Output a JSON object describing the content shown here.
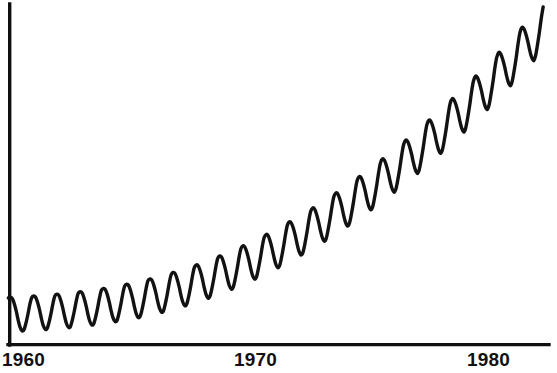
{
  "chart_data": {
    "type": "line",
    "title": "",
    "subtitle": "",
    "xlabel": "",
    "ylabel": "",
    "grid": false,
    "legend": null,
    "legend_position": "none",
    "series_color": "#121212",
    "axis_color": "#101010",
    "background_color": "#ffffff",
    "xlim": [
      1959.2,
      1982.3
    ],
    "ylim": [
      0,
      100
    ],
    "x_tick_labels": [
      "1960",
      "1970",
      "1980"
    ],
    "x_tick_values": [
      1960,
      1970,
      1980
    ],
    "y_tick_labels": [],
    "y_tick_values": [],
    "annotations": [],
    "series": [
      {
        "name": "series-1",
        "x": [
          1959.2,
          1959.29,
          1959.37,
          1959.45,
          1959.54,
          1959.62,
          1959.7,
          1959.79,
          1959.87,
          1959.95,
          1960.04,
          1960.12,
          1960.2,
          1960.29,
          1960.37,
          1960.45,
          1960.54,
          1960.62,
          1960.7,
          1960.79,
          1960.87,
          1960.95,
          1961.04,
          1961.12,
          1961.2,
          1961.29,
          1961.37,
          1961.45,
          1961.54,
          1961.62,
          1961.7,
          1961.79,
          1961.87,
          1961.95,
          1962.04,
          1962.12,
          1962.2,
          1962.29,
          1962.37,
          1962.45,
          1962.54,
          1962.62,
          1962.7,
          1962.79,
          1962.87,
          1962.95,
          1963.04,
          1963.12,
          1963.2,
          1963.29,
          1963.37,
          1963.45,
          1963.54,
          1963.62,
          1963.7,
          1963.79,
          1963.87,
          1963.95,
          1964.04,
          1964.12,
          1964.2,
          1964.29,
          1964.37,
          1964.45,
          1964.54,
          1964.62,
          1964.7,
          1964.79,
          1964.87,
          1964.95,
          1965.04,
          1965.12,
          1965.2,
          1965.29,
          1965.37,
          1965.45,
          1965.54,
          1965.62,
          1965.7,
          1965.79,
          1965.87,
          1965.95,
          1966.04,
          1966.12,
          1966.2,
          1966.29,
          1966.37,
          1966.45,
          1966.54,
          1966.62,
          1966.7,
          1966.79,
          1966.87,
          1966.95,
          1967.04,
          1967.12,
          1967.2,
          1967.29,
          1967.37,
          1967.45,
          1967.54,
          1967.62,
          1967.7,
          1967.79,
          1967.87,
          1967.95,
          1968.04,
          1968.12,
          1968.2,
          1968.29,
          1968.37,
          1968.45,
          1968.54,
          1968.62,
          1968.7,
          1968.79,
          1968.87,
          1968.95,
          1969.04,
          1969.12,
          1969.2,
          1969.29,
          1969.37,
          1969.45,
          1969.54,
          1969.62,
          1969.7,
          1969.79,
          1969.87,
          1969.95,
          1970.04,
          1970.12,
          1970.2,
          1970.29,
          1970.37,
          1970.45,
          1970.54,
          1970.62,
          1970.7,
          1970.79,
          1970.87,
          1970.95,
          1971.04,
          1971.12,
          1971.2,
          1971.29,
          1971.37,
          1971.45,
          1971.54,
          1971.62,
          1971.7,
          1971.79,
          1971.87,
          1971.95,
          1972.04,
          1972.12,
          1972.2,
          1972.29,
          1972.37,
          1972.45,
          1972.54,
          1972.62,
          1972.7,
          1972.79,
          1972.87,
          1972.95,
          1973.04,
          1973.12,
          1973.2,
          1973.29,
          1973.37,
          1973.45,
          1973.54,
          1973.62,
          1973.7,
          1973.79,
          1973.87,
          1973.95,
          1974.04,
          1974.12,
          1974.2,
          1974.29,
          1974.37,
          1974.45,
          1974.54,
          1974.62,
          1974.7,
          1974.79,
          1974.87,
          1974.95,
          1975.04,
          1975.12,
          1975.2,
          1975.29,
          1975.37,
          1975.45,
          1975.54,
          1975.62,
          1975.7,
          1975.79,
          1975.87,
          1975.95,
          1976.04,
          1976.12,
          1976.2,
          1976.29,
          1976.37,
          1976.45,
          1976.54,
          1976.62,
          1976.7,
          1976.79,
          1976.87,
          1976.95,
          1977.04,
          1977.12,
          1977.2,
          1977.29,
          1977.37,
          1977.45,
          1977.54,
          1977.62,
          1977.7,
          1977.79,
          1977.87,
          1977.95,
          1978.04,
          1978.12,
          1978.2,
          1978.29,
          1978.37,
          1978.45,
          1978.54,
          1978.62,
          1978.7,
          1978.79,
          1978.87,
          1978.95,
          1979.04,
          1979.12,
          1979.2,
          1979.29,
          1979.37,
          1979.45,
          1979.54,
          1979.62,
          1979.7,
          1979.79,
          1979.87,
          1979.95,
          1980.04,
          1980.12,
          1980.2,
          1980.29,
          1980.37,
          1980.45,
          1980.54,
          1980.62,
          1980.7,
          1980.79,
          1980.87,
          1980.95,
          1981.04,
          1981.12,
          1981.2,
          1981.29,
          1981.37,
          1981.45,
          1981.54,
          1981.62,
          1981.7,
          1981.79,
          1981.87,
          1981.95,
          1982.04,
          1982.12,
          1982.2
        ],
        "values": [
          22.3,
          22.6,
          21.9,
          19.6,
          15.8,
          11.6,
          8.2,
          6.4,
          6.9,
          9.9,
          14.4,
          19.0,
          22.4,
          23.2,
          22.6,
          20.3,
          16.5,
          12.3,
          8.9,
          7.1,
          7.6,
          10.6,
          15.2,
          19.8,
          23.3,
          24.1,
          23.5,
          21.2,
          17.4,
          13.2,
          9.8,
          8.0,
          8.5,
          11.6,
          16.2,
          20.9,
          24.5,
          25.3,
          24.7,
          22.4,
          18.6,
          14.4,
          11.0,
          9.2,
          9.8,
          12.9,
          17.6,
          22.4,
          26.0,
          26.9,
          26.3,
          24.0,
          20.2,
          16.0,
          12.6,
          10.8,
          11.4,
          14.6,
          19.4,
          24.3,
          28.0,
          28.9,
          28.3,
          26.0,
          22.2,
          18.0,
          14.6,
          12.8,
          13.5,
          16.8,
          21.7,
          26.7,
          30.5,
          31.5,
          30.9,
          28.6,
          24.8,
          20.6,
          17.2,
          15.4,
          16.1,
          19.5,
          24.5,
          29.6,
          33.5,
          34.6,
          34.0,
          31.7,
          27.9,
          23.7,
          20.3,
          18.5,
          19.3,
          22.8,
          27.9,
          33.1,
          37.1,
          38.3,
          37.7,
          35.4,
          31.6,
          27.4,
          24.0,
          22.2,
          23.1,
          26.7,
          31.9,
          37.2,
          41.3,
          42.6,
          42.0,
          39.7,
          35.9,
          31.7,
          28.3,
          26.5,
          27.5,
          31.2,
          36.5,
          41.9,
          46.1,
          47.5,
          46.9,
          44.6,
          40.8,
          36.6,
          33.2,
          31.4,
          32.5,
          36.3,
          41.7,
          47.2,
          51.5,
          53.0,
          52.4,
          50.1,
          46.3,
          42.1,
          38.7,
          36.9,
          38.1,
          42.0,
          47.5,
          53.1,
          57.5,
          59.1,
          58.5,
          56.2,
          52.4,
          48.2,
          44.8,
          43.0,
          44.3,
          48.3,
          53.9,
          59.6,
          64.1,
          65.8,
          65.2,
          62.9,
          59.1,
          54.9,
          51.5,
          49.7,
          51.1,
          55.2,
          60.9,
          66.7,
          71.3,
          73.1,
          72.5,
          70.2,
          66.4,
          62.2,
          58.8,
          57.0,
          58.5,
          62.7,
          68.5,
          74.4,
          79.1,
          81.0,
          80.4,
          78.1,
          74.3,
          70.1,
          66.7,
          64.9,
          66.5,
          70.8,
          76.7,
          82.7,
          87.5,
          89.5,
          88.9,
          86.6,
          82.8,
          78.6,
          75.2,
          73.4,
          75.1,
          79.5,
          85.5,
          91.6,
          96.5,
          98.6,
          98.0,
          95.7,
          91.9,
          87.7,
          84.3,
          82.5,
          84.3,
          88.8,
          94.9,
          101.1,
          106.1,
          108.3,
          107.7,
          105.4,
          101.6,
          97.4,
          94.0,
          92.2,
          94.1,
          98.7,
          104.9,
          111.2,
          116.3,
          118.6,
          118.0,
          115.7,
          111.9,
          107.7,
          104.3,
          102.5,
          104.5,
          109.2,
          115.5,
          121.9,
          127.1,
          129.5,
          128.9,
          126.6,
          122.8,
          118.6,
          115.2,
          113.4,
          115.5,
          120.3,
          126.7,
          133.2,
          138.5,
          141.0,
          140.4,
          138.1,
          134.3,
          130.1,
          126.7,
          124.9,
          127.1,
          132.0,
          138.5,
          145.1,
          150.5,
          153.1,
          152.5,
          150.2,
          146.4,
          142.2,
          138.8,
          137.0,
          139.3,
          144.3,
          150.9,
          157.6,
          163.0
        ]
      }
    ]
  },
  "axis": {
    "x_labels": [
      {
        "text": "1960",
        "center_px": 27
      },
      {
        "text": "1970",
        "center_px": 259
      },
      {
        "text": "1980",
        "center_px": 492
      }
    ]
  }
}
